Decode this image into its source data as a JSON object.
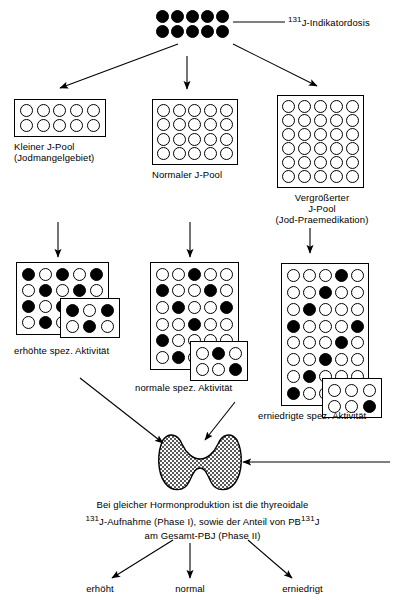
{
  "top": {
    "dose_label_sup": "131",
    "dose_label": "J-Indikatordosis",
    "dose_cols": 5,
    "dose_rows": 2,
    "dose_filled": true
  },
  "pools": [
    {
      "id": "small-pool",
      "cols": 5,
      "rows": 2,
      "label_lines": [
        "Kleiner J-Pool",
        "(Jodmangelgebiet)"
      ]
    },
    {
      "id": "normal-pool",
      "cols": 5,
      "rows": 4,
      "label_lines": [
        "Normaler J-Pool"
      ]
    },
    {
      "id": "enlarged-pool",
      "cols": 5,
      "rows": 6,
      "label_lines": [
        "Vergrößerter",
        "J-Pool",
        "(Jod-Praemedikation)"
      ]
    }
  ],
  "activity_groups": [
    {
      "id": "high-activity",
      "label": "erhöhte spez. Aktivität",
      "main_cols": 5,
      "main_rows": 4,
      "main_pattern": [
        [
          1,
          0,
          1,
          0,
          1
        ],
        [
          0,
          1,
          0,
          1,
          0
        ],
        [
          1,
          0,
          1,
          0,
          1
        ],
        [
          0,
          1,
          0,
          1,
          0
        ]
      ],
      "inset_cols": 3,
      "inset_rows": 2,
      "inset_pattern": [
        [
          1,
          0,
          1
        ],
        [
          0,
          1,
          0
        ]
      ]
    },
    {
      "id": "normal-activity",
      "label": "normale spez. Aktivität",
      "main_cols": 5,
      "main_rows": 6,
      "main_pattern": [
        [
          0,
          0,
          1,
          0,
          0
        ],
        [
          1,
          0,
          0,
          1,
          0
        ],
        [
          0,
          1,
          0,
          0,
          1
        ],
        [
          0,
          0,
          1,
          0,
          0
        ],
        [
          1,
          0,
          0,
          0,
          0
        ],
        [
          0,
          1,
          0,
          0,
          0
        ]
      ],
      "inset_cols": 3,
      "inset_rows": 2,
      "inset_pattern": [
        [
          0,
          1,
          0
        ],
        [
          0,
          0,
          1
        ]
      ]
    },
    {
      "id": "low-activity",
      "label": "erniedrigte spez. Aktivität",
      "main_cols": 5,
      "main_rows": 8,
      "main_pattern": [
        [
          0,
          0,
          0,
          1,
          0
        ],
        [
          0,
          0,
          1,
          0,
          0
        ],
        [
          0,
          1,
          0,
          0,
          0
        ],
        [
          1,
          0,
          0,
          0,
          1
        ],
        [
          0,
          0,
          0,
          1,
          0
        ],
        [
          0,
          0,
          1,
          0,
          0
        ],
        [
          0,
          1,
          0,
          0,
          0
        ],
        [
          1,
          0,
          0,
          0,
          0
        ]
      ],
      "inset_cols": 3,
      "inset_rows": 2,
      "inset_pattern": [
        [
          0,
          0,
          0
        ],
        [
          0,
          0,
          1
        ]
      ]
    }
  ],
  "thyroid": {
    "name": "thyroid-gland"
  },
  "conclusion": {
    "line1": "Bei gleicher Hormonproduktion ist die thyreoidale",
    "line2_sup": "131",
    "line2_a": "J-Aufnahme (Phase I), sowie der Anteil von PB",
    "line2_sup2": "131",
    "line2_b": "J",
    "line3": "am Gesamt-PBJ  (Phase II)"
  },
  "outcomes": [
    {
      "id": "outcome-increased",
      "label": "erhöht"
    },
    {
      "id": "outcome-normal",
      "label": "normal"
    },
    {
      "id": "outcome-decreased",
      "label": "erniedrigt"
    }
  ],
  "colors": {
    "ink": "#000000",
    "paper": "#ffffff"
  }
}
